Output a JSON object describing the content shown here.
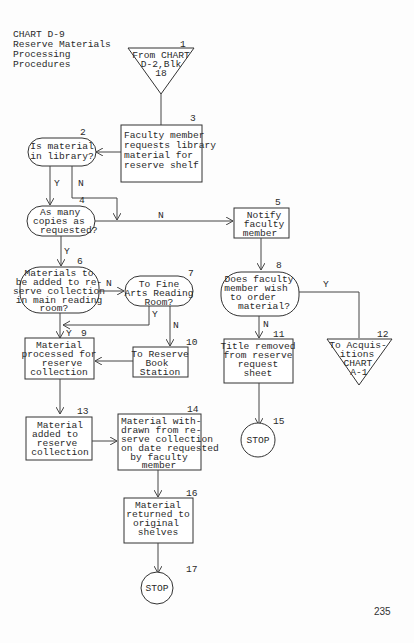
{
  "header": {
    "lines": [
      "CHART D-9",
      "Reserve Materials",
      "Processing",
      "Procedures"
    ]
  },
  "page_number": "235",
  "nodes": {
    "n1": {
      "number": "1",
      "type": "off-page-connector",
      "lines": [
        "From CHART",
        "D-2,Blk",
        "18"
      ]
    },
    "n2": {
      "number": "2",
      "type": "decision",
      "lines": [
        "Is material",
        "in library?"
      ]
    },
    "n3": {
      "number": "3",
      "type": "process",
      "lines": [
        "Faculty member",
        "requests library",
        "material for",
        "reserve shelf"
      ]
    },
    "n4": {
      "number": "4",
      "type": "decision",
      "lines": [
        "As many",
        "copies as",
        "requested?"
      ]
    },
    "n5": {
      "number": "5",
      "type": "process",
      "lines": [
        "Notify",
        "faculty",
        "member"
      ]
    },
    "n6": {
      "number": "6",
      "type": "decision",
      "lines": [
        "Materials to",
        "be added to re-",
        "serve collection",
        "in main reading",
        "room?"
      ]
    },
    "n7": {
      "number": "7",
      "type": "decision",
      "lines": [
        "To Fine",
        "Arts Reading",
        "Room?"
      ]
    },
    "n8": {
      "number": "8",
      "type": "decision",
      "lines": [
        "Does faculty",
        "member wish",
        "to order",
        "material?"
      ]
    },
    "n9": {
      "number": "9",
      "type": "process",
      "lines": [
        "Material",
        "processed for",
        "reserve",
        "collection"
      ]
    },
    "n10": {
      "number": "10",
      "type": "process",
      "lines": [
        "To Reserve",
        "Book",
        "Station"
      ]
    },
    "n11": {
      "number": "11",
      "type": "process",
      "lines": [
        "Title removed",
        "from reserve",
        "request",
        "sheet"
      ]
    },
    "n12": {
      "number": "12",
      "type": "off-page-connector",
      "lines": [
        "To Acquis-",
        "itions",
        "CHART",
        "A-1"
      ]
    },
    "n13": {
      "number": "13",
      "type": "process",
      "lines": [
        "Material",
        "added to",
        "reserve",
        "collection"
      ]
    },
    "n14": {
      "number": "14",
      "type": "process",
      "lines": [
        "Material with-",
        "drawn from re-",
        "serve collection",
        "on date requested",
        "by faculty",
        "member"
      ]
    },
    "n15": {
      "number": "15",
      "type": "terminal",
      "lines": [
        "STOP"
      ]
    },
    "n16": {
      "number": "16",
      "type": "process",
      "lines": [
        "Material",
        "returned to",
        "original",
        "shelves"
      ]
    },
    "n17": {
      "number": "17",
      "type": "terminal",
      "lines": [
        "STOP"
      ]
    }
  },
  "edge_labels": {
    "n2_yes": "Y",
    "n2_no": "N",
    "n4_yes": "Y",
    "n4_no": "N",
    "n6_yes": "Y",
    "n6_no": "N",
    "n7_yes": "Y",
    "n7_no": "N",
    "n8_yes": "Y",
    "n8_no": "N"
  },
  "colors": {
    "ink": "#333333",
    "paper": "#fdfdfd"
  }
}
